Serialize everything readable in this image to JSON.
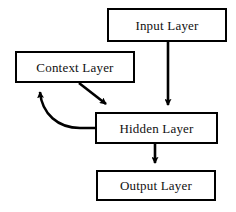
{
  "diagram": {
    "type": "flow-diagram",
    "background_color": "#ffffff",
    "stroke_color": "#000000",
    "text_color": "#111111",
    "nodes": [
      {
        "id": "input",
        "label": "Input Layer",
        "x": 107,
        "y": 8,
        "width": 120,
        "height": 34
      },
      {
        "id": "context",
        "label": "Context Layer",
        "x": 15,
        "y": 51,
        "width": 120,
        "height": 32
      },
      {
        "id": "hidden",
        "label": "Hidden Layer",
        "x": 95,
        "y": 112,
        "width": 123,
        "height": 32
      },
      {
        "id": "output",
        "label": "Output Layer",
        "x": 96,
        "y": 170,
        "width": 120,
        "height": 31
      }
    ],
    "edges": [
      {
        "id": "input-to-hidden",
        "from": "input",
        "to": "hidden",
        "style": "straight-vertical",
        "arrowhead": true
      },
      {
        "id": "context-to-hidden",
        "from": "context",
        "to": "hidden",
        "style": "straight-diagonal",
        "arrowhead": true
      },
      {
        "id": "hidden-to-context",
        "from": "hidden",
        "to": "context",
        "style": "curved-feedback",
        "arrowhead": true
      },
      {
        "id": "hidden-to-output",
        "from": "hidden",
        "to": "output",
        "style": "straight-vertical",
        "arrowhead": true
      }
    ]
  }
}
